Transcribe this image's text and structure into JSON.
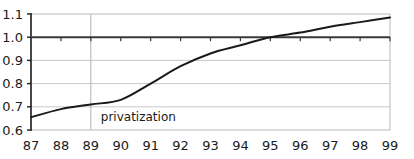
{
  "chart_data": {
    "type": "line",
    "title": "",
    "xlabel": "",
    "ylabel": "",
    "x": [
      87,
      88,
      89,
      90,
      91,
      92,
      93,
      94,
      95,
      96,
      97,
      98,
      99
    ],
    "categories": [
      "87",
      "88",
      "89",
      "90",
      "91",
      "92",
      "93",
      "94",
      "95",
      "96",
      "97",
      "98",
      "99"
    ],
    "values": [
      0.655,
      0.69,
      0.71,
      0.73,
      0.8,
      0.875,
      0.93,
      0.965,
      1.0,
      1.02,
      1.045,
      1.065,
      1.085
    ],
    "series": [
      {
        "name": "",
        "values": [
          0.655,
          0.69,
          0.71,
          0.73,
          0.8,
          0.875,
          0.93,
          0.965,
          1.0,
          1.02,
          1.045,
          1.065,
          1.085
        ]
      }
    ],
    "xlim": [
      87,
      99
    ],
    "ylim": [
      0.6,
      1.1
    ],
    "ytick_labels": [
      "1.1",
      "1.0",
      "0.9",
      "0.8",
      "0.7",
      "0.6"
    ],
    "ytick_values": [
      1.1,
      1.0,
      0.9,
      0.8,
      0.7,
      0.6
    ],
    "xtick_labels": [
      "87",
      "88",
      "89",
      "90",
      "91",
      "92",
      "93",
      "94",
      "95",
      "96",
      "97",
      "98",
      "99"
    ],
    "grid": true,
    "grid_orientation": "horizontal",
    "legend": null,
    "legend_position": "none",
    "reference_line": {
      "axis": "y",
      "value": 1.0,
      "label": "1.0",
      "style": "solid-bold"
    },
    "event_marker": {
      "axis": "x",
      "value": 89,
      "label": "privatization",
      "style": "vertical-line"
    },
    "annotations": [
      {
        "text": "privatization",
        "x": 89.2,
        "y": 0.655
      }
    ],
    "colors": {
      "line": "#1a1a1a",
      "grid": "#c9c9c9",
      "axis": "#333333",
      "reference_line": "#3a3a3a",
      "event_line": "#b0b0b0",
      "background": "#ffffff",
      "text": "#1a1a1a"
    }
  }
}
